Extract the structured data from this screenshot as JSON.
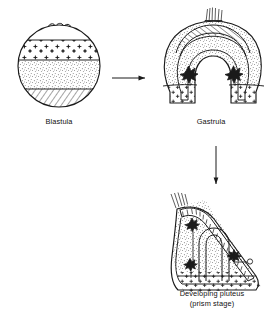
{
  "figure": {
    "background_color": "#ffffff",
    "ink_color": "#1a1a1a",
    "stages": [
      {
        "id": "blastula",
        "label": "Blastula",
        "shape": "sphere",
        "description": "Spherical blastula with apical tuft of cilia at animal pole and horizontal fate-map bands",
        "features": [
          {
            "name": "apical-tuft",
            "position": "animal pole (top)",
            "count": 3
          },
          {
            "name": "animal-band-stars",
            "pattern": "star-stipple",
            "position": "upper"
          },
          {
            "name": "equatorial-band-stipple",
            "pattern": "fine-stipple",
            "position": "middle"
          },
          {
            "name": "vegetal-band-hatch",
            "pattern": "diagonal-hatch",
            "position": "lower"
          }
        ]
      },
      {
        "id": "gastrula",
        "label": "Gastrula",
        "shape": "inverted-u",
        "description": "Gastrula in section showing invaginated archenteron, hatched ectodermal crown, stippled walls and primary mesenchyme clusters",
        "features": [
          {
            "name": "apical-tuft",
            "position": "top",
            "count": 1
          },
          {
            "name": "ectoderm-hatch-band",
            "pattern": "diagonal-hatch",
            "position": "apex"
          },
          {
            "name": "ectoderm-stipple-wall",
            "pattern": "fine-stipple",
            "position": "lateral"
          },
          {
            "name": "primary-mesenchyme-cluster",
            "pattern": "dark-cluster",
            "count": 2
          },
          {
            "name": "vegetal-star-band",
            "pattern": "star-stipple",
            "position": "vegetal"
          },
          {
            "name": "archenteron",
            "pattern": "outline",
            "position": "center"
          }
        ]
      },
      {
        "id": "pluteus",
        "label": "Developing pluteus\n(prism stage)",
        "label_line1": "Developing pluteus",
        "label_line2": "(prism stage)",
        "shape": "wedge",
        "description": "Prism-stage pluteus larva with apical tuft, hatched ciliated band, gut tube and skeletal rods",
        "features": [
          {
            "name": "apical-tuft",
            "position": "upper left",
            "count": 1
          },
          {
            "name": "ciliated-hatch-band",
            "pattern": "ladder-hatch",
            "position": "dorsal"
          },
          {
            "name": "ectoderm-stipple",
            "pattern": "fine-stipple",
            "position": "lateral"
          },
          {
            "name": "gut-tube",
            "pattern": "outline",
            "position": "center"
          },
          {
            "name": "skeletal-rod",
            "pattern": "dark-rod",
            "count": 2
          },
          {
            "name": "vegetal-star-band",
            "pattern": "star-stipple",
            "position": "ventral"
          }
        ]
      }
    ],
    "arrows": [
      {
        "name": "arrow-blastula-to-gastrula",
        "direction": "right",
        "from": "blastula",
        "to": "gastrula"
      },
      {
        "name": "arrow-gastrula-to-pluteus",
        "direction": "down",
        "from": "gastrula",
        "to": "pluteus"
      }
    ]
  }
}
